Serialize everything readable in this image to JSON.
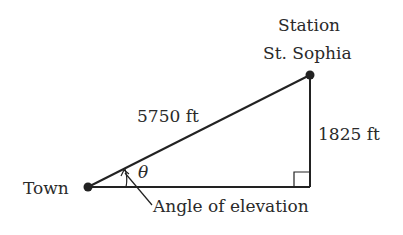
{
  "diagram": {
    "points": {
      "town": {
        "label": "Town"
      },
      "station": {
        "label_line1": "Station",
        "label_line2": "St. Sophia"
      }
    },
    "hypotenuse": {
      "label": "5750 ft"
    },
    "vertical_side": {
      "label": "1825 ft"
    },
    "angle": {
      "symbol": "θ",
      "label": "Angle of elevation"
    },
    "colors": {
      "line": "#222222",
      "text": "#2a2a2a"
    }
  }
}
